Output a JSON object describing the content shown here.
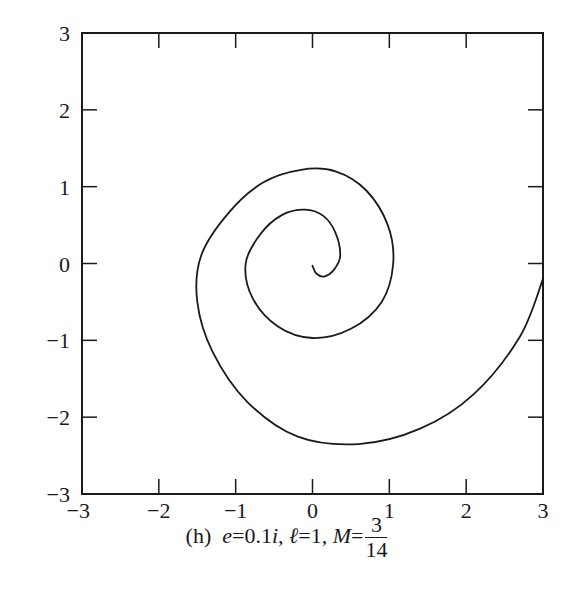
{
  "chart_data": {
    "type": "line",
    "title": "",
    "caption": {
      "label": "(h)",
      "e_var": "e",
      "e_value": "0.1",
      "e_imag": "i",
      "l_var": "ℓ",
      "l_value": "1",
      "m_var": "M",
      "m_num": "3",
      "m_den": "14"
    },
    "xlabel": "",
    "ylabel": "",
    "xlim": [
      -3,
      3
    ],
    "ylim": [
      -3,
      3
    ],
    "x_ticks": [
      "−3",
      "−2",
      "−1",
      "0",
      "1",
      "2",
      "3"
    ],
    "y_ticks": [
      "3",
      "2",
      "1",
      "0",
      "−1",
      "−2",
      "−3"
    ],
    "grid": false,
    "legend": null,
    "series": [
      {
        "name": "orbit spiral",
        "style": "solid black line",
        "points": [
          [
            0.0,
            -0.03
          ],
          [
            0.05,
            -0.13
          ],
          [
            0.15,
            -0.17
          ],
          [
            0.28,
            -0.08
          ],
          [
            0.36,
            0.1
          ],
          [
            0.3,
            0.4
          ],
          [
            0.14,
            0.62
          ],
          [
            -0.1,
            0.7
          ],
          [
            -0.4,
            0.63
          ],
          [
            -0.68,
            0.38
          ],
          [
            -0.87,
            0.0
          ],
          [
            -0.78,
            -0.45
          ],
          [
            -0.45,
            -0.82
          ],
          [
            0.0,
            -0.97
          ],
          [
            0.5,
            -0.85
          ],
          [
            0.9,
            -0.5
          ],
          [
            1.05,
            0.0
          ],
          [
            0.98,
            0.5
          ],
          [
            0.7,
            0.95
          ],
          [
            0.3,
            1.2
          ],
          [
            -0.15,
            1.22
          ],
          [
            -0.65,
            1.05
          ],
          [
            -1.1,
            0.65
          ],
          [
            -1.45,
            0.1
          ],
          [
            -1.5,
            -0.5
          ],
          [
            -1.3,
            -1.15
          ],
          [
            -0.85,
            -1.8
          ],
          [
            -0.2,
            -2.25
          ],
          [
            0.6,
            -2.35
          ],
          [
            1.4,
            -2.15
          ],
          [
            2.1,
            -1.7
          ],
          [
            2.7,
            -0.95
          ],
          [
            3.0,
            -0.2
          ]
        ]
      }
    ]
  }
}
